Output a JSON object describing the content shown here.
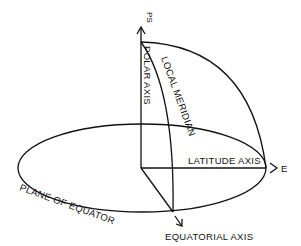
{
  "diagram": {
    "type": "celestial-coordinate-axes",
    "labels": {
      "pole": "PS",
      "polar_axis": "POLAR AXIS",
      "local_meridian": "LOCAL MERIDIAN",
      "latitude_axis": "LATITUDE AXIS",
      "east": "E",
      "plane_of_equator": "PLANE OF EQUATOR",
      "equatorial_axis": "EQUATORIAL AXIS"
    },
    "colors": {
      "stroke": "#111111",
      "background": "#ffffff"
    }
  }
}
